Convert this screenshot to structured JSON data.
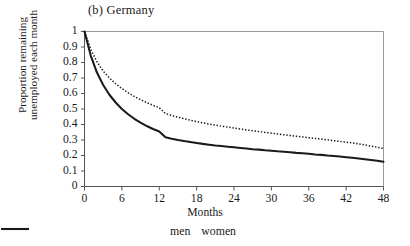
{
  "chart_data": {
    "type": "line",
    "title": "(b) Germany",
    "xlabel": "Months",
    "ylabel_lines": [
      "Proportion remaining",
      "unemployed each month"
    ],
    "xlim": [
      0,
      48
    ],
    "ylim": [
      0,
      1
    ],
    "grid": false,
    "legend_position": "bottom-center",
    "xticks": [
      0,
      6,
      12,
      18,
      24,
      30,
      36,
      42,
      48
    ],
    "xtick_labels": [
      "0",
      "6",
      "12",
      "18",
      "24",
      "30",
      "36",
      "42",
      "48"
    ],
    "yticks": [
      0,
      0.1,
      0.2,
      0.3,
      0.4,
      0.5,
      0.6,
      0.7,
      0.8,
      0.9,
      1
    ],
    "ytick_labels": [
      "0",
      "0.1",
      "0.2",
      "0.3",
      "0.4",
      "0.5",
      "0.6",
      "0.7",
      "0.8",
      "0.9",
      "1"
    ],
    "x": [
      0,
      1,
      2,
      3,
      4,
      5,
      6,
      7,
      8,
      9,
      10,
      11,
      12,
      13,
      14,
      15,
      16,
      17,
      18,
      19,
      20,
      21,
      22,
      23,
      24,
      25,
      26,
      27,
      28,
      29,
      30,
      31,
      32,
      33,
      34,
      35,
      36,
      37,
      38,
      39,
      40,
      41,
      42,
      43,
      44,
      45,
      46,
      47,
      48
    ],
    "series": [
      {
        "name": "men",
        "style": "solid",
        "color": "#1a1a1a",
        "values": [
          1.0,
          0.845,
          0.735,
          0.655,
          0.592,
          0.542,
          0.5,
          0.466,
          0.437,
          0.412,
          0.39,
          0.371,
          0.355,
          0.318,
          0.308,
          0.3,
          0.293,
          0.287,
          0.281,
          0.275,
          0.27,
          0.265,
          0.261,
          0.257,
          0.253,
          0.249,
          0.245,
          0.241,
          0.238,
          0.234,
          0.231,
          0.227,
          0.224,
          0.221,
          0.217,
          0.214,
          0.211,
          0.207,
          0.204,
          0.2,
          0.197,
          0.193,
          0.189,
          0.185,
          0.181,
          0.176,
          0.171,
          0.166,
          0.16
        ]
      },
      {
        "name": "women",
        "style": "dotted",
        "color": "#1a1a1a",
        "values": [
          1.0,
          0.885,
          0.805,
          0.745,
          0.7,
          0.663,
          0.632,
          0.605,
          0.581,
          0.56,
          0.541,
          0.524,
          0.508,
          0.47,
          0.458,
          0.447,
          0.437,
          0.428,
          0.419,
          0.411,
          0.403,
          0.396,
          0.389,
          0.383,
          0.377,
          0.371,
          0.365,
          0.36,
          0.354,
          0.349,
          0.344,
          0.339,
          0.334,
          0.329,
          0.324,
          0.32,
          0.315,
          0.31,
          0.306,
          0.301,
          0.296,
          0.291,
          0.286,
          0.281,
          0.275,
          0.268,
          0.261,
          0.253,
          0.245
        ]
      }
    ],
    "legend": [
      {
        "label": "men",
        "style": "solid"
      },
      {
        "label": "women",
        "style": "dotted"
      }
    ]
  }
}
